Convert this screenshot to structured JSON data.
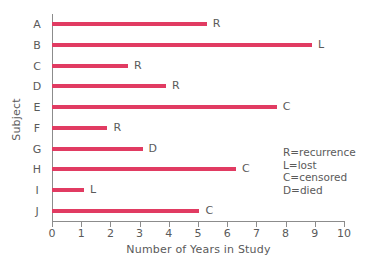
{
  "chart_data": {
    "type": "bar",
    "orientation": "horizontal",
    "title": "",
    "xlabel": "Number of Years in Study",
    "ylabel": "Subject",
    "xlim": [
      0,
      10
    ],
    "grid": false,
    "bar_color": "#E13B62",
    "axis_color": "#8C8C8C",
    "text_color": "#5A5A5A",
    "categories": [
      "A",
      "B",
      "C",
      "D",
      "E",
      "F",
      "G",
      "H",
      "I",
      "J"
    ],
    "values": [
      5.3,
      8.9,
      2.6,
      3.9,
      7.7,
      1.9,
      3.1,
      6.3,
      1.1,
      5.05
    ],
    "point_labels": [
      "R",
      "L",
      "R",
      "R",
      "C",
      "R",
      "D",
      "C",
      "L",
      "C"
    ],
    "xticks": [
      0,
      1,
      2,
      3,
      4,
      5,
      6,
      7,
      8,
      9,
      10
    ],
    "xticklabels": [
      "0",
      "1",
      "2",
      "3",
      "4",
      "5",
      "6",
      "7",
      "8",
      "9",
      "10"
    ],
    "legend_position": "inside-lower-right",
    "legend_entries": [
      "R=recurrence",
      "L=lost",
      "C=censored",
      "D=died"
    ]
  }
}
